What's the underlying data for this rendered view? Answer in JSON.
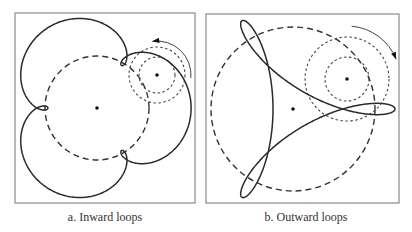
{
  "figure": {
    "panels": [
      {
        "id": "a",
        "caption": "a. Inward loops",
        "frame": {
          "x": 15,
          "y": 13,
          "w": 180,
          "h": 190
        },
        "center": {
          "x": 97,
          "y": 108
        },
        "base_circle_radius": 52,
        "curve": {
          "type": "epitrochoid",
          "lobes": 3,
          "r": 17.9,
          "d": 22.5,
          "rotation_deg": 180
        },
        "rolling_circle": {
          "center": {
            "x": 157,
            "y": 75
          },
          "inner_radius": 18,
          "outer_radius": 28
        },
        "arrow": {
          "cx": 157,
          "cy": 75,
          "r": 34,
          "from_deg": 5,
          "to_deg": -98,
          "direction": "counterclockwise"
        },
        "caption_x": 105
      },
      {
        "id": "b",
        "caption": "b. Outward loops",
        "frame": {
          "x": 206,
          "y": 14,
          "w": 193,
          "h": 189
        },
        "center": {
          "x": 293,
          "y": 109
        },
        "base_circle_radius": 82,
        "curve": {
          "type": "hypotrochoid",
          "lobes": 3,
          "r": 30.5,
          "d": 41,
          "rotation_deg": 0
        },
        "rolling_circle": {
          "center": {
            "x": 347,
            "y": 79
          },
          "inner_radius": 22,
          "outer_radius": 42
        },
        "arrow": {
          "cx": 347,
          "cy": 79,
          "r": 53,
          "from_deg": -85,
          "to_deg": -22,
          "direction": "clockwise"
        },
        "caption_x": 306
      }
    ]
  }
}
